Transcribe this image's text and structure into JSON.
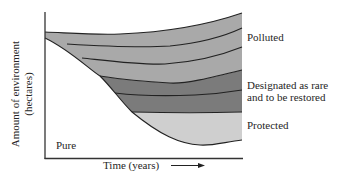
{
  "diagram": {
    "y_axis_label_line1": "Amount of environment",
    "y_axis_label_line2": "(hectares)",
    "x_axis_label": "Time (years)",
    "regions": [
      {
        "id": "polluted",
        "label": "Polluted",
        "color": "#a9a9a9"
      },
      {
        "id": "designated",
        "label_line1": "Designated as rare",
        "label_line2": "and to be restored",
        "color": "#7b7b7b"
      },
      {
        "id": "protected",
        "label": "Protected",
        "color": "#cfcfcf"
      },
      {
        "id": "pure",
        "label": "Pure",
        "color": "#ffffff"
      }
    ],
    "colors": {
      "line": "#222222",
      "polluted_band": "#a9a9a9",
      "designated_band": "#7b7b7b",
      "protected_band": "#cfcfcf"
    }
  }
}
